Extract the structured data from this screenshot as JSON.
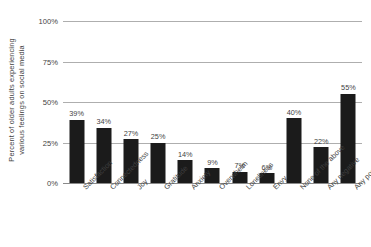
{
  "chart_data": {
    "type": "bar",
    "title": "",
    "xlabel": "",
    "ylabel": "Percent of older adults experiencing various feelings on social media",
    "ylabel_lines": [
      "Percent of older adults experiencing",
      "various feelings on social media"
    ],
    "categories": [
      "Satisfaction",
      "Connectedness",
      "Joy",
      "Gratitude",
      "Anxiety",
      "Overwhelm",
      "Loneliness",
      "Envy",
      "None of the above",
      "Any negative",
      "Any positive"
    ],
    "values": [
      39,
      34,
      27,
      25,
      14,
      9,
      7,
      6,
      40,
      22,
      55
    ],
    "value_labels": [
      "39%",
      "34%",
      "27%",
      "25%",
      "14%",
      "9%",
      "7%",
      "6%",
      "40%",
      "22%",
      "55%"
    ],
    "ylim": [
      0,
      100
    ],
    "y_ticks": [
      0,
      25,
      50,
      75,
      100
    ],
    "y_tick_labels": [
      "0%",
      "25%",
      "50%",
      "75%",
      "100%"
    ],
    "grid": true,
    "legend": false,
    "bar_color": "#1b1b1b",
    "gridline_color": "#aeaeae",
    "axis_color": "#8a8a8a",
    "text_color": "#3f3f3f",
    "background": "#ffffff"
  }
}
